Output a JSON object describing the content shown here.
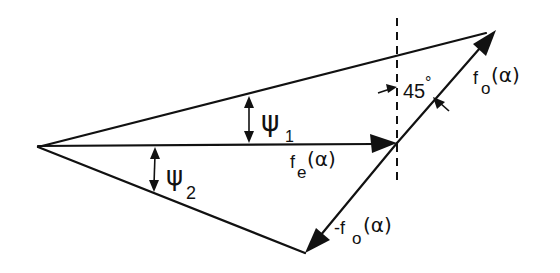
{
  "diagram": {
    "type": "vector-triangle",
    "colors": {
      "ink": "#111111",
      "background": "#ffffff"
    },
    "points": {
      "origin": [
        38,
        147
      ],
      "fe_tip": [
        397,
        143
      ],
      "fo_tip": [
        496,
        30
      ],
      "minus_fo_tip": [
        305,
        253
      ]
    },
    "vectors": [
      {
        "id": "fe",
        "label_main": "f",
        "label_sub": "e",
        "label_arg": "(α)"
      },
      {
        "id": "fo",
        "label_main": "f",
        "label_sub": "o",
        "label_arg": "(α)"
      },
      {
        "id": "minus_fo",
        "label_main": "-f",
        "label_sub": "o",
        "label_arg": "(α)"
      }
    ],
    "angles": [
      {
        "id": "psi1",
        "symbol": "ψ",
        "sub": "1"
      },
      {
        "id": "psi2",
        "symbol": "ψ",
        "sub": "2"
      },
      {
        "id": "angle45",
        "text": "45",
        "unit": "°"
      }
    ],
    "reference_line": {
      "style": "dashed",
      "orientation": "vertical"
    }
  }
}
